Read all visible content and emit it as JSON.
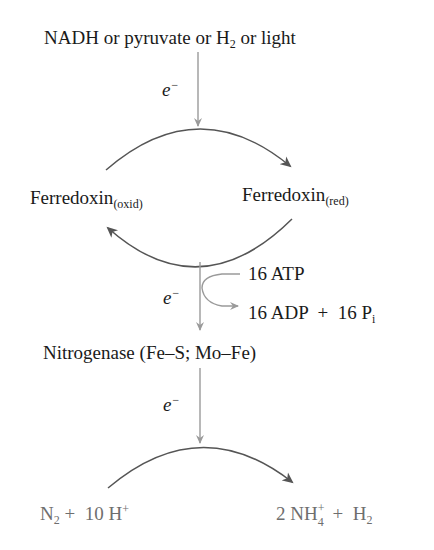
{
  "diagram": {
    "source": {
      "text": "NADH or pyruvate or H",
      "sub": "2",
      "tail": " or light"
    },
    "electron_label": "e",
    "electron_sup": "−",
    "ferredoxin_oxid": {
      "text": "Ferredoxin",
      "sub": "(oxid)"
    },
    "ferredoxin_red": {
      "text": "Ferredoxin",
      "sub": "(red)"
    },
    "atp_input": "16 ATP",
    "atp_output": {
      "text": "16 ADP  +  16 P",
      "sub": "i"
    },
    "enzyme": "Nitrogenase (Fe–S; Mo–Fe)",
    "reactants": {
      "n": "N",
      "n_sub": "2",
      "rest": " +  10 H",
      "h_sup": "+"
    },
    "products": {
      "coef": "2 NH",
      "nh_sup": "+",
      "nh_sub": "4",
      "rest": " +  H",
      "h_sub": "2"
    },
    "colors": {
      "text": "#1a1a1a",
      "reaction_text": "#6e6e6e",
      "arrow_gray": "#9a9a9a",
      "arc": "#555555"
    }
  }
}
